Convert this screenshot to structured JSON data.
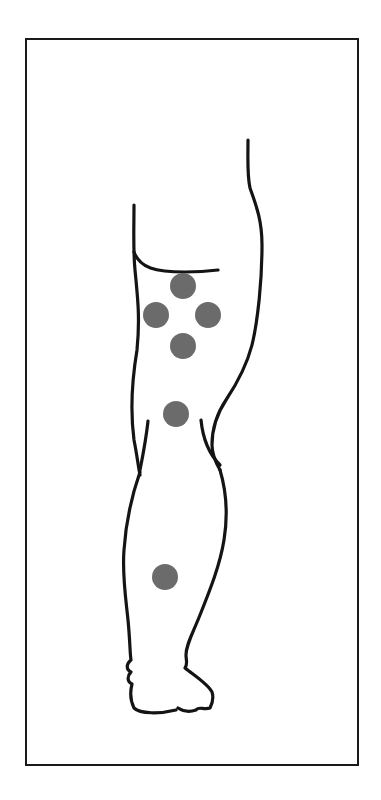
{
  "diagram": {
    "frame": {
      "x": 25,
      "y": 38,
      "width": 334,
      "height": 728,
      "stroke": "#1a1a1a"
    },
    "outline_color": "#141414",
    "dot_color": "#6b6b6b",
    "dots": [
      {
        "id": "upper-thigh-top",
        "cx": 183,
        "cy": 286,
        "r": 13
      },
      {
        "id": "upper-thigh-left",
        "cx": 156,
        "cy": 315,
        "r": 13
      },
      {
        "id": "upper-thigh-right",
        "cx": 208,
        "cy": 315,
        "r": 13
      },
      {
        "id": "upper-thigh-bottom",
        "cx": 183,
        "cy": 346,
        "r": 13
      },
      {
        "id": "above-knee",
        "cx": 176,
        "cy": 414,
        "r": 13
      },
      {
        "id": "lower-leg",
        "cx": 165,
        "cy": 577,
        "r": 13
      }
    ]
  }
}
